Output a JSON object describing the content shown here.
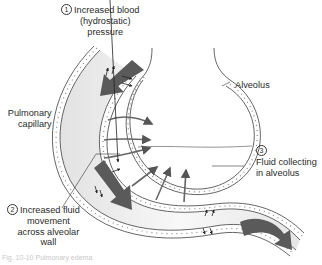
{
  "diagram": {
    "labels": {
      "step1": {
        "number": "1",
        "line1": "Increased blood",
        "line2": "(hydrostatic)",
        "line3": "pressure"
      },
      "step2": {
        "number": "2",
        "line1": "Increased fluid",
        "line2": "movement",
        "line3": "across alveolar",
        "line4": "wall"
      },
      "step3": {
        "number": "3",
        "line1": "Fluid collecting",
        "line2": "in alveolus"
      },
      "alveolus": "Alveolus",
      "capillary": {
        "line1": "Pulmonary",
        "line2": "capillary"
      }
    },
    "caption": "Fig. 10-10 Pulmonary edema",
    "colors": {
      "arrow_large": "#5a5a5a",
      "arrow_fluid": "#6e6e6e",
      "wall_stroke": "#555555",
      "lumen_fill": "#efefef",
      "background": "#ffffff"
    }
  }
}
